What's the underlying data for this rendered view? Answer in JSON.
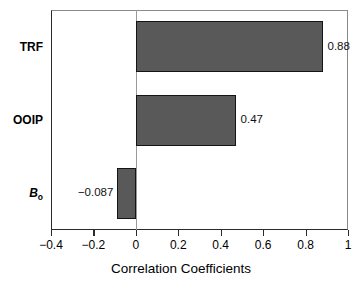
{
  "chart_data": {
    "type": "bar",
    "orientation": "horizontal",
    "title": "",
    "xlabel": "Correlation Coefficients",
    "ylabel": "",
    "categories": [
      "TRF",
      "OOIP",
      "Bo"
    ],
    "category_labels": [
      {
        "text": "TRF",
        "style": "bold"
      },
      {
        "text": "OOIP",
        "style": "bold"
      },
      {
        "text": "B",
        "subscript": "o",
        "style": "bold-italic"
      }
    ],
    "values": [
      0.88,
      0.47,
      -0.087
    ],
    "value_labels": [
      "0.88",
      "0.47",
      "−0.087"
    ],
    "xlim": [
      -0.4,
      1.0
    ],
    "xticks": [
      -0.4,
      -0.2,
      0,
      0.2,
      0.4,
      0.6,
      0.8,
      1
    ],
    "xtick_labels": [
      "−0.4",
      "−0.2",
      "0",
      "0.2",
      "0.4",
      "0.6",
      "0.8",
      "1"
    ],
    "grid": false,
    "legend": false,
    "bar_fill_color": "#595959",
    "bar_edge_color": "#141414",
    "axis_color": "#2b2b2b",
    "background_color": "#ffffff"
  }
}
